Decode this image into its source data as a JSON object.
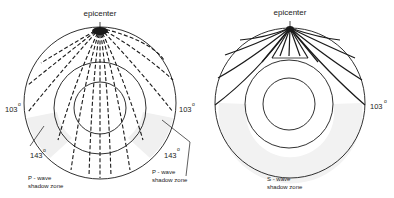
{
  "left_diagram": {
    "title": "P-wave",
    "epicenter_label": "epicenter",
    "angle_left_103": "103",
    "angle_right_103": "103",
    "angle_left_143": "143",
    "angle_right_143": "143",
    "degree_symbol": "o",
    "shadow_zone_left": {
      "line1": "P - wave",
      "line2": "shadow zone"
    },
    "shadow_zone_right": {
      "line1": "P - wave",
      "line2": "shadow zone"
    }
  },
  "right_diagram": {
    "title": "S-wave",
    "epicenter_label": "epicenter",
    "angle_right_103": "103",
    "degree_symbol": "o",
    "shadow_zone": {
      "line1": "S - wave",
      "line2": "shadow zone"
    }
  },
  "colors": {
    "line": "#1a1a1a",
    "shadow": "#f0f0f0",
    "background": "#ffffff"
  }
}
